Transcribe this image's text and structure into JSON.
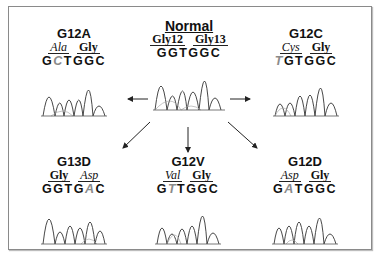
{
  "figure": {
    "center": {
      "title": "Normal",
      "codons": [
        {
          "label": "Gly12",
          "italic": false
        },
        {
          "label": "Gly13",
          "italic": false
        }
      ],
      "sequence": [
        "G",
        "G",
        "T",
        "G",
        "G",
        "C"
      ],
      "mutant_index": -1
    },
    "panels": [
      {
        "id": "G12A",
        "title": "G12A",
        "codons": [
          {
            "label": "Ala",
            "italic": true
          },
          {
            "label": "Gly",
            "italic": false
          }
        ],
        "sequence": [
          "G",
          "C",
          "T",
          "G",
          "G",
          "C"
        ],
        "mutant_index": 1
      },
      {
        "id": "G12C",
        "title": "G12C",
        "codons": [
          {
            "label": "Cys",
            "italic": true
          },
          {
            "label": "Gly",
            "italic": false
          }
        ],
        "sequence": [
          "T",
          "G",
          "T",
          "G",
          "G",
          "C"
        ],
        "mutant_index": 0
      },
      {
        "id": "G13D",
        "title": "G13D",
        "codons": [
          {
            "label": "Gly",
            "italic": false
          },
          {
            "label": "Asp",
            "italic": true
          }
        ],
        "sequence": [
          "G",
          "G",
          "T",
          "G",
          "A",
          "C"
        ],
        "mutant_index": 4
      },
      {
        "id": "G12V",
        "title": "G12V",
        "codons": [
          {
            "label": "Val",
            "italic": true
          },
          {
            "label": "Gly",
            "italic": false
          }
        ],
        "sequence": [
          "G",
          "T",
          "T",
          "G",
          "G",
          "C"
        ],
        "mutant_index": 1
      },
      {
        "id": "G12D",
        "title": "G12D",
        "codons": [
          {
            "label": "Asp",
            "italic": true
          },
          {
            "label": "Gly",
            "italic": false
          }
        ],
        "sequence": [
          "G",
          "A",
          "T",
          "G",
          "G",
          "C"
        ],
        "mutant_index": 1
      }
    ],
    "colors": {
      "text": "#111111",
      "mutant_base": "#8a8a8a",
      "trace": "#333333",
      "trace_secondary": "#aaaaaa",
      "border": "#8a8a8a"
    }
  }
}
